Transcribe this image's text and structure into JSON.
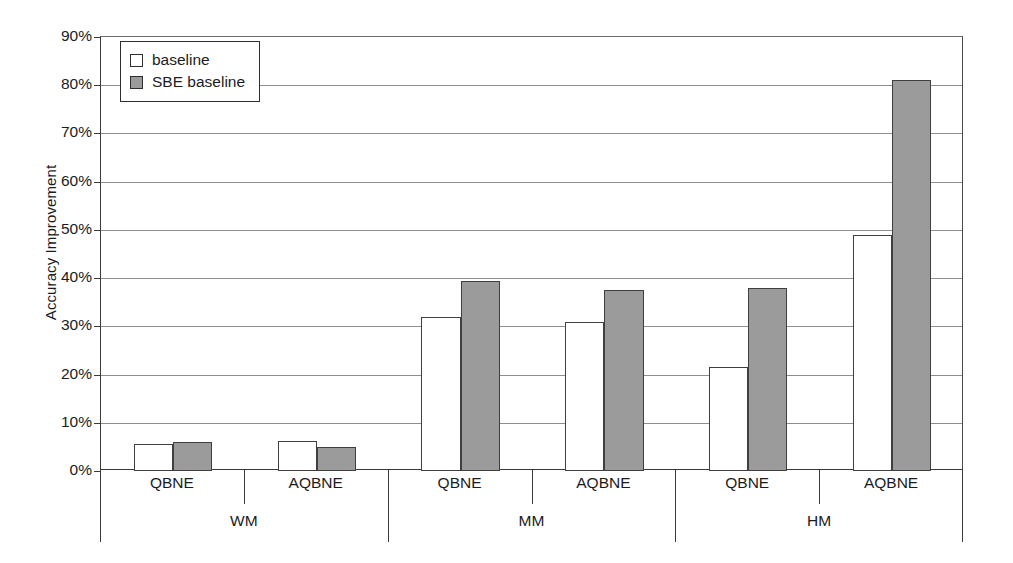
{
  "chart_data": {
    "type": "bar",
    "title": "",
    "xlabel": "",
    "ylabel": "Accuracy Improvement",
    "ylim": [
      0,
      90
    ],
    "y_unit": "%",
    "grid": true,
    "legend_position": "top-left",
    "y_ticks": [
      "0%",
      "10%",
      "20%",
      "30%",
      "40%",
      "50%",
      "60%",
      "70%",
      "80%",
      "90%"
    ],
    "y_tick_values": [
      0,
      10,
      20,
      30,
      40,
      50,
      60,
      70,
      80,
      90
    ],
    "categories": [
      "QBNE",
      "AQBNE",
      "QBNE",
      "AQBNE",
      "QBNE",
      "AQBNE"
    ],
    "groups": [
      {
        "label": "WM",
        "categories": [
          "QBNE",
          "AQBNE"
        ]
      },
      {
        "label": "MM",
        "categories": [
          "QBNE",
          "AQBNE"
        ]
      },
      {
        "label": "HM",
        "categories": [
          "QBNE",
          "AQBNE"
        ]
      }
    ],
    "series": [
      {
        "name": "baseline",
        "color": "#ffffff",
        "values": [
          5.5,
          6.2,
          32.0,
          31.0,
          21.5,
          49.0
        ]
      },
      {
        "name": "SBE baseline",
        "color": "#9b9b9b",
        "values": [
          6.0,
          5.0,
          39.5,
          37.5,
          38.0,
          81.0
        ]
      }
    ]
  },
  "legend": {
    "items": [
      {
        "label": "baseline",
        "swatch": "white-square-icon"
      },
      {
        "label": "SBE baseline",
        "swatch": "gray-square-icon"
      }
    ]
  },
  "axes": {
    "y_title": "Accuracy Improvement"
  }
}
